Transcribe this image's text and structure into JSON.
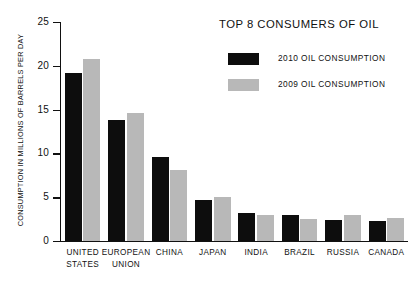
{
  "chart_data": {
    "type": "bar",
    "title": "TOP 8 CONSUMERS OF OIL",
    "xlabel": "",
    "ylabel": "CONSUMPTION IN MILLIONS OF BARRELS PER DAY",
    "ylim": [
      0,
      25
    ],
    "ytick_labels": [
      "0",
      "5",
      "10",
      "15",
      "20",
      "25"
    ],
    "yticks": [
      0,
      5,
      10,
      15,
      20,
      25
    ],
    "grid": false,
    "legend_position": "top-right",
    "categories": [
      "UNITED\nSTATES",
      "EUROPEAN\nUNION",
      "CHINA",
      "JAPAN",
      "INDIA",
      "BRAZIL",
      "RUSSIA",
      "CANADA"
    ],
    "series": [
      {
        "name": "2010 OIL CONSUMPTION",
        "color": "#0d0d0d",
        "values": [
          19.2,
          13.8,
          9.6,
          4.7,
          3.2,
          3.0,
          2.4,
          2.3
        ]
      },
      {
        "name": "2009 OIL CONSUMPTION",
        "color": "#b8b8b8",
        "values": [
          20.8,
          14.6,
          8.1,
          5.0,
          3.0,
          2.5,
          3.0,
          2.6
        ]
      }
    ]
  }
}
